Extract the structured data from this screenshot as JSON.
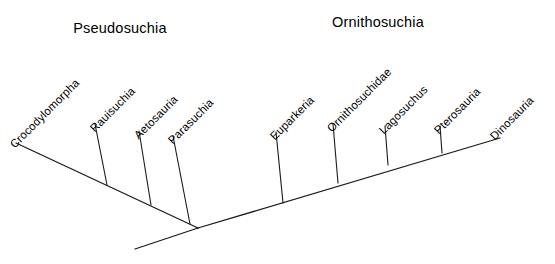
{
  "figure": {
    "width": 555,
    "height": 264,
    "background_color": "#ffffff",
    "line_color": "#1a1a1a"
  },
  "clade_titles": [
    {
      "label": "Pseudosuchia",
      "x": 120,
      "y": 28
    },
    {
      "label": "Ornithosuchia",
      "x": 378,
      "y": 22
    }
  ],
  "chart_data": {
    "type": "diagram",
    "diagram_type": "cladogram",
    "title": "",
    "root": {
      "x": 198,
      "y": 228
    },
    "root_stem_end": {
      "x": 135,
      "y": 249
    },
    "backbones": [
      {
        "name": "Pseudosuchia",
        "from": {
          "x": 198,
          "y": 228
        },
        "to": {
          "x": 16,
          "y": 143
        },
        "terminal_taxon": "Crocodylomorpha"
      },
      {
        "name": "Ornithosuchia",
        "from": {
          "x": 198,
          "y": 228
        },
        "to": {
          "x": 500,
          "y": 138
        },
        "terminal_taxon": "Dinosauria"
      }
    ],
    "taxa": [
      {
        "name": "Crocodylomorpha",
        "clade": "Pseudosuchia",
        "terminal": true,
        "tip": {
          "x": 16,
          "y": 143
        },
        "label_x": 12,
        "label_y": 140,
        "label_angle": -45
      },
      {
        "name": "Rauisuchia",
        "clade": "Pseudosuchia",
        "terminal": false,
        "node": {
          "x": 107,
          "y": 185
        },
        "tip": {
          "x": 95,
          "y": 124
        },
        "label_x": 92,
        "label_y": 124,
        "label_angle": -45
      },
      {
        "name": "Aetosauria",
        "clade": "Pseudosuchia",
        "terminal": false,
        "node": {
          "x": 151,
          "y": 205
        },
        "tip": {
          "x": 139,
          "y": 131
        },
        "label_x": 136,
        "label_y": 131,
        "label_angle": -45
      },
      {
        "name": "Parasuchia",
        "clade": "Pseudosuchia",
        "terminal": false,
        "node": {
          "x": 190,
          "y": 224
        },
        "tip": {
          "x": 173,
          "y": 136
        },
        "label_x": 170,
        "label_y": 136,
        "label_angle": -45
      },
      {
        "name": "Euparkeria",
        "clade": "Ornithosuchia",
        "terminal": false,
        "node": {
          "x": 283,
          "y": 203
        },
        "tip": {
          "x": 276,
          "y": 132
        },
        "label_x": 272,
        "label_y": 132,
        "label_angle": -45
      },
      {
        "name": "Ornithosuchidae",
        "clade": "Ornithosuchia",
        "terminal": false,
        "node": {
          "x": 338,
          "y": 183
        },
        "tip": {
          "x": 333,
          "y": 124
        },
        "label_x": 329,
        "label_y": 124,
        "label_angle": -45
      },
      {
        "name": "Lagosuchus",
        "clade": "Ornithosuchia",
        "terminal": false,
        "node": {
          "x": 388,
          "y": 165
        },
        "tip": {
          "x": 385,
          "y": 126
        },
        "label_x": 381,
        "label_y": 126,
        "label_angle": -45
      },
      {
        "name": "Pterosauria",
        "clade": "Ornithosuchia",
        "terminal": false,
        "node": {
          "x": 442,
          "y": 153
        },
        "tip": {
          "x": 440,
          "y": 126
        },
        "label_x": 436,
        "label_y": 126,
        "label_angle": -45
      },
      {
        "name": "Dinosauria",
        "clade": "Ornithosuchia",
        "terminal": true,
        "tip": {
          "x": 500,
          "y": 138
        },
        "label_x": 492,
        "label_y": 132,
        "label_angle": -45
      }
    ]
  }
}
